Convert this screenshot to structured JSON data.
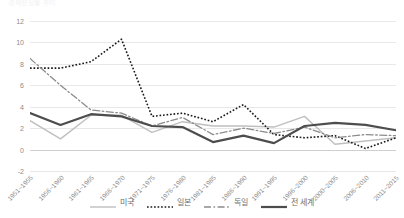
{
  "chart_data": {
    "type": "line",
    "title": "경제성장률 추이",
    "xlabel": "",
    "ylabel": "",
    "ylim": [
      -2,
      12
    ],
    "yticks": [
      "12",
      "10",
      "8",
      "6",
      "4",
      "2",
      "0",
      "-2"
    ],
    "grid": true,
    "legend_position": "bottom",
    "categories": [
      "1951~1955",
      "1956~1960",
      "1961~1965",
      "1966~1970",
      "1971~1975",
      "1976~1980",
      "1981~1985",
      "1986~1990",
      "1991~1995",
      "1996~2000",
      "2000~2005",
      "2006~2010",
      "2011~2015"
    ],
    "series": [
      {
        "name": "미국",
        "style": "solid-light",
        "color": "#bfbfbf",
        "width": 1.4,
        "values": [
          2.7,
          1.0,
          3.2,
          3.2,
          1.6,
          2.6,
          2.2,
          2.2,
          2.1,
          3.1,
          0.5,
          0.8,
          1.1
        ]
      },
      {
        "name": "일본",
        "style": "dotted",
        "color": "#1a1a1a",
        "width": 1.6,
        "values": [
          7.6,
          7.6,
          8.2,
          10.3,
          3.1,
          3.4,
          2.6,
          4.2,
          1.4,
          1.1,
          1.3,
          0.1,
          1.1
        ]
      },
      {
        "name": "독일",
        "style": "dashdot",
        "color": "#8c8c8c",
        "width": 1.3,
        "values": [
          8.5,
          6.0,
          3.7,
          3.4,
          2.2,
          3.0,
          1.4,
          2.0,
          1.5,
          2.1,
          1.1,
          1.4,
          1.3
        ]
      },
      {
        "name": "전 세계",
        "style": "solid-bold",
        "color": "#4d4d4d",
        "width": 2.2,
        "values": [
          3.4,
          2.3,
          3.3,
          3.1,
          2.2,
          2.1,
          0.7,
          1.3,
          0.6,
          2.2,
          2.5,
          2.3,
          1.8
        ]
      }
    ]
  }
}
